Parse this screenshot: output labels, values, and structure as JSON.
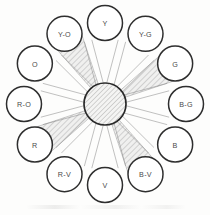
{
  "figure": {
    "name": "twelve-hue-color-wheel",
    "background_color": "#fdfdfc",
    "outline_color": "#2e2e2e",
    "spoke_color": "#8d8d8d",
    "shaded_wedge_color": "#b9b9b9",
    "hub": {
      "label": "",
      "fill_style": "diagonal-hatch",
      "center_x": 105,
      "center_y": 104,
      "radius": 21
    },
    "geometry": {
      "center_x": 105,
      "center_y": 104,
      "ring_radius": 81,
      "node_radius": 17.5
    }
  },
  "chart_data": {
    "type": "pie",
    "title": "",
    "subtitle": "",
    "xlabel": "",
    "ylabel": "",
    "legend_position": "none",
    "grid": false,
    "hue_count": 12,
    "step_degrees": 30,
    "categories": [
      "Y",
      "Y-G",
      "G",
      "B-G",
      "B",
      "B-V",
      "V",
      "R-V",
      "R",
      "R-O",
      "O",
      "Y-O"
    ],
    "values": [
      30,
      30,
      30,
      30,
      30,
      30,
      30,
      30,
      30,
      30,
      30,
      30
    ],
    "annotations": [
      "Y-O",
      "G",
      "R",
      "B-V"
    ],
    "nodes": [
      {
        "label": "Y",
        "angle_deg": 0,
        "shaded": false
      },
      {
        "label": "Y-G",
        "angle_deg": 30,
        "shaded": false
      },
      {
        "label": "G",
        "angle_deg": 60,
        "shaded": true
      },
      {
        "label": "B-G",
        "angle_deg": 90,
        "shaded": false
      },
      {
        "label": "B",
        "angle_deg": 120,
        "shaded": false
      },
      {
        "label": "B-V",
        "angle_deg": 150,
        "shaded": true
      },
      {
        "label": "V",
        "angle_deg": 180,
        "shaded": false
      },
      {
        "label": "R-V",
        "angle_deg": 210,
        "shaded": false
      },
      {
        "label": "R",
        "angle_deg": 240,
        "shaded": true
      },
      {
        "label": "R-O",
        "angle_deg": 270,
        "shaded": false
      },
      {
        "label": "O",
        "angle_deg": 300,
        "shaded": false
      },
      {
        "label": "Y-O",
        "angle_deg": 330,
        "shaded": true
      }
    ]
  }
}
